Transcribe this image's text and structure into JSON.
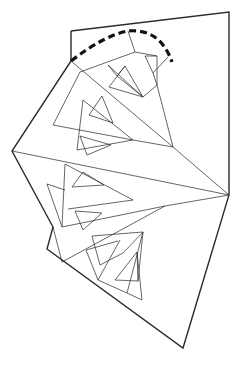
{
  "diagram": {
    "type": "line-art-fractal-fold-pattern",
    "width": 240,
    "height": 367,
    "colors": {
      "stroke": "#2a2a2a",
      "background": "#ffffff",
      "dashed": "#111111"
    },
    "outline": [
      [
        71,
        31
      ],
      [
        229,
        12
      ],
      [
        229,
        195
      ],
      [
        183,
        348
      ],
      [
        47,
        249
      ],
      [
        53,
        227
      ],
      [
        12,
        151
      ],
      [
        71,
        61
      ],
      [
        71,
        31
      ]
    ],
    "dashed_arc": "M71,61 Q105,35 128,31 Q160,28 172,62",
    "lines": [
      [
        [
          71,
          61
        ],
        [
          173,
          147
        ]
      ],
      [
        [
          12,
          151
        ],
        [
          229,
          195
        ]
      ],
      [
        [
          173,
          147
        ],
        [
          229,
          195
        ]
      ],
      [
        [
          165,
          206
        ],
        [
          229,
          195
        ]
      ],
      [
        [
          128,
          31
        ],
        [
          135,
          52
        ]
      ],
      [
        [
          135,
          52
        ],
        [
          80,
          72
        ]
      ],
      [
        [
          80,
          72
        ],
        [
          53,
          125
        ]
      ],
      [
        [
          53,
          125
        ],
        [
          133,
          140
        ]
      ],
      [
        [
          133,
          140
        ],
        [
          173,
          147
        ]
      ],
      [
        [
          135,
          52
        ],
        [
          157,
          56
        ]
      ],
      [
        [
          157,
          56
        ],
        [
          157,
          85
        ]
      ],
      [
        [
          157,
          85
        ],
        [
          173,
          147
        ]
      ],
      [
        [
          145,
          56
        ],
        [
          157,
          56
        ]
      ],
      [
        [
          145,
          56
        ],
        [
          153,
          73
        ]
      ],
      [
        [
          153,
          73
        ],
        [
          157,
          85
        ]
      ],
      [
        [
          153,
          73
        ],
        [
          168,
          57
        ]
      ],
      [
        [
          108,
          65
        ],
        [
          143,
          97
        ]
      ],
      [
        [
          108,
          65
        ],
        [
          117,
          76
        ]
      ],
      [
        [
          117,
          76
        ],
        [
          143,
          97
        ]
      ],
      [
        [
          143,
          97
        ],
        [
          157,
          85
        ]
      ],
      [
        [
          125,
          66
        ],
        [
          109,
          87
        ]
      ],
      [
        [
          109,
          87
        ],
        [
          143,
          97
        ]
      ],
      [
        [
          125,
          66
        ],
        [
          143,
          97
        ]
      ],
      [
        [
          117,
          76
        ],
        [
          125,
          66
        ]
      ],
      [
        [
          83,
          100
        ],
        [
          77,
          150
        ]
      ],
      [
        [
          83,
          100
        ],
        [
          133,
          140
        ]
      ],
      [
        [
          102,
          96
        ],
        [
          89,
          115
        ]
      ],
      [
        [
          89,
          115
        ],
        [
          113,
          123
        ]
      ],
      [
        [
          102,
          96
        ],
        [
          113,
          123
        ]
      ],
      [
        [
          77,
          150
        ],
        [
          133,
          140
        ]
      ],
      [
        [
          80,
          136
        ],
        [
          87,
          155
        ]
      ],
      [
        [
          87,
          155
        ],
        [
          111,
          145
        ]
      ],
      [
        [
          80,
          136
        ],
        [
          111,
          145
        ]
      ],
      [
        [
          65,
          164
        ],
        [
          62,
          227
        ]
      ],
      [
        [
          65,
          164
        ],
        [
          133,
          200
        ]
      ],
      [
        [
          83,
          172
        ],
        [
          72,
          187
        ]
      ],
      [
        [
          72,
          187
        ],
        [
          104,
          185
        ]
      ],
      [
        [
          83,
          172
        ],
        [
          104,
          185
        ]
      ],
      [
        [
          68,
          209
        ],
        [
          133,
          200
        ]
      ],
      [
        [
          75,
          211
        ],
        [
          83,
          230
        ]
      ],
      [
        [
          83,
          230
        ],
        [
          102,
          213
        ]
      ],
      [
        [
          75,
          211
        ],
        [
          102,
          213
        ]
      ],
      [
        [
          47,
          184
        ],
        [
          62,
          227
        ]
      ],
      [
        [
          47,
          184
        ],
        [
          65,
          190
        ]
      ],
      [
        [
          62,
          227
        ],
        [
          165,
          206
        ]
      ],
      [
        [
          53,
          227
        ],
        [
          62,
          262
        ]
      ],
      [
        [
          62,
          262
        ],
        [
          165,
          206
        ]
      ],
      [
        [
          92,
          236
        ],
        [
          143,
          232
        ]
      ],
      [
        [
          92,
          236
        ],
        [
          100,
          265
        ]
      ],
      [
        [
          100,
          265
        ],
        [
          123,
          253
        ]
      ],
      [
        [
          123,
          253
        ],
        [
          143,
          232
        ]
      ],
      [
        [
          86,
          250
        ],
        [
          98,
          280
        ]
      ],
      [
        [
          98,
          280
        ],
        [
          120,
          240
        ]
      ],
      [
        [
          86,
          250
        ],
        [
          118,
          241
        ]
      ],
      [
        [
          98,
          280
        ],
        [
          127,
          293
        ]
      ],
      [
        [
          127,
          293
        ],
        [
          143,
          232
        ]
      ],
      [
        [
          115,
          280
        ],
        [
          138,
          281
        ]
      ],
      [
        [
          115,
          280
        ],
        [
          137,
          252
        ]
      ],
      [
        [
          137,
          252
        ],
        [
          138,
          281
        ]
      ],
      [
        [
          138,
          281
        ],
        [
          143,
          232
        ]
      ],
      [
        [
          127,
          293
        ],
        [
          142,
          300
        ]
      ],
      [
        [
          142,
          300
        ],
        [
          137,
          252
        ]
      ]
    ]
  }
}
